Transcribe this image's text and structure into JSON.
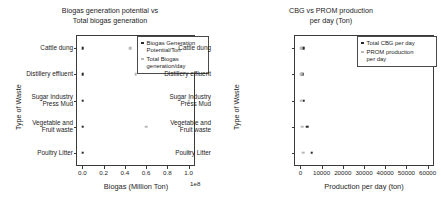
{
  "chart_data": [
    {
      "type": "scatter",
      "title": "Biogas generation potential vs\nTotal biogas generation",
      "xlabel": "Biogas (Million Ton)",
      "ylabel": "Type of Waste",
      "x_exponent_label": "1e8",
      "grid": false,
      "legend_position": "upper right",
      "categories": [
        "Cattle dung",
        "Distillery effluent",
        "Sugar Industry\nPress Mud",
        "Vegetable and\nFruit waste",
        "Poultry Litter"
      ],
      "xticks": [
        "0.0",
        "0.2",
        "0.4",
        "0.6",
        "0.8",
        "1.0"
      ],
      "xtick_values": [
        0.0,
        0.2,
        0.4,
        0.6,
        0.8,
        1.0
      ],
      "xlim": [
        -0.06,
        1.06
      ],
      "series": [
        {
          "name": "Biogas Generation\nPotential/Ton",
          "color": "#2a2a2a",
          "values": [
            0.003,
            0.003,
            0.003,
            0.003,
            0.003
          ]
        },
        {
          "name": "Total Biogas\ngeneration/day",
          "color": "#b9b9b9",
          "values": [
            0.45,
            0.5,
            1.0,
            0.6,
            1.0
          ]
        }
      ]
    },
    {
      "type": "scatter",
      "title": "CBG vs PROM production\nper day (Ton)",
      "xlabel": "Production per day (ton)",
      "ylabel": "Type of Waste",
      "grid": false,
      "legend_position": "upper right",
      "categories": [
        "Cattle dung",
        "Distillery effluent",
        "Sugar Industry\nPress Mud",
        "Vegetable and\nFruit waste",
        "Poultry Litter"
      ],
      "xticks": [
        "0",
        "10000",
        "20000",
        "30000",
        "40000",
        "50000",
        "60000"
      ],
      "xtick_values": [
        0,
        10000,
        20000,
        30000,
        40000,
        50000,
        60000
      ],
      "xlim": [
        -3000,
        63000
      ],
      "series": [
        {
          "name": "Total CBG per day",
          "color": "#2a2a2a",
          "values": [
            1200,
            1000,
            1600,
            3300,
            5400
          ]
        },
        {
          "name": "PROM production\nper day",
          "color": "#b9b9b9",
          "values": [
            400,
            350,
            500,
            900,
            1400
          ]
        }
      ]
    }
  ]
}
